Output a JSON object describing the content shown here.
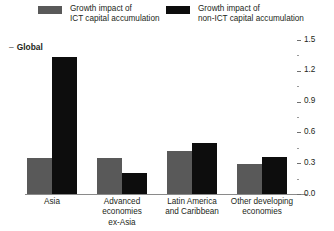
{
  "legend": {
    "entries": [
      {
        "label_line1": "Growth impact of",
        "label_line2": "ICT capital accumulation",
        "color": "#595959",
        "swatch_icon": "legend-swatch-icon"
      },
      {
        "label_line1": "Growth impact of",
        "label_line2": "non-ICT capital accumulation",
        "color": "#0d0d0d",
        "swatch_icon": "legend-swatch-icon"
      }
    ]
  },
  "annotations": {
    "global_label": "Global",
    "global_dash": "–"
  },
  "axis": {
    "tick_dash": "–",
    "labels": [
      "0.0",
      "0.3",
      "0.6",
      "0.9",
      "1.2",
      "1.5"
    ]
  },
  "chart_data": {
    "type": "bar",
    "title": "",
    "subtitle": "",
    "xlabel": "",
    "ylabel": "",
    "ylim": [
      0.0,
      1.5
    ],
    "ytick_values": [
      0.0,
      0.3,
      0.6,
      0.9,
      1.2,
      1.5
    ],
    "ytick_labels": [
      "0.0",
      "0.3",
      "0.6",
      "0.9",
      "1.2",
      "1.5"
    ],
    "yminor_tick_values": [
      0.15,
      0.45,
      0.75,
      1.05,
      1.35
    ],
    "yaxis_position": "right",
    "grid": false,
    "legend_position": "top",
    "annotation_label": "Global",
    "categories": [
      "Asia",
      "Advanced economies ex-Asia",
      "Latin America and Caribbean",
      "Other developing economies"
    ],
    "category_lines": [
      [
        "Asia"
      ],
      [
        "Advanced economies",
        "ex-Asia"
      ],
      [
        "Latin America",
        "and Caribbean"
      ],
      [
        "Other developing",
        "economies"
      ]
    ],
    "series": [
      {
        "name": "Growth impact of ICT capital accumulation",
        "color": "#595959",
        "values": [
          0.35,
          0.35,
          0.42,
          0.29
        ]
      },
      {
        "name": "Growth impact of non-ICT capital accumulation",
        "color": "#0d0d0d",
        "values": [
          1.33,
          0.2,
          0.5,
          0.36
        ]
      }
    ]
  }
}
